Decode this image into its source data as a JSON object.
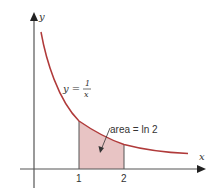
{
  "diagram": {
    "axis_x_label": "x",
    "axis_y_label": "y",
    "curve_label_lhs": "y =",
    "curve_label_num": "1",
    "curve_label_den": "x",
    "area_label": "area = ln 2",
    "tick_labels": [
      "1",
      "2"
    ],
    "colors": {
      "curve": "#b03a3a",
      "shade": "#e8c4c4",
      "axis": "#333333"
    }
  }
}
